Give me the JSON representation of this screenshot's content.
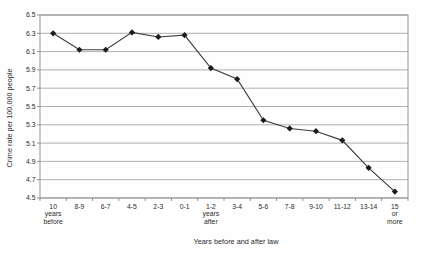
{
  "chart_data": {
    "type": "line",
    "title": "",
    "xlabel": "Years before and after law",
    "ylabel": "Crime rate per 100,000 people",
    "categories": [
      "10\nyears\nbefore",
      "8-9",
      "6-7",
      "4-5",
      "2-3",
      "0-1",
      "1-2\nyears\nafter",
      "3-4",
      "5-6",
      "7-8",
      "9-10",
      "11-12",
      "13-14",
      "15\nor\nmore"
    ],
    "series": [
      {
        "name": "Crime rate",
        "values": [
          6.3,
          6.12,
          6.12,
          6.31,
          6.26,
          6.28,
          5.92,
          5.8,
          5.35,
          5.26,
          5.23,
          5.13,
          4.83,
          4.57
        ]
      }
    ],
    "ylim": [
      4.5,
      6.5
    ],
    "ytick_step": 0.2,
    "ytick_labels": [
      "4.5",
      "4.7",
      "4.9",
      "5.1",
      "5.3",
      "5.5",
      "5.7",
      "5.9",
      "6.1",
      "6.3",
      "6.5"
    ],
    "grid": "horizontal-only",
    "legend": "none",
    "marker": "diamond",
    "colors": {
      "line": "#3d3d3d",
      "marker": "#1c1c1c",
      "grid": "#9a9a9a",
      "border": "#8a8a8a",
      "text": "#2b2b2b",
      "background": "#fefefe"
    }
  }
}
